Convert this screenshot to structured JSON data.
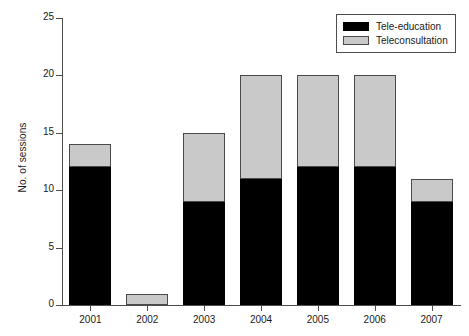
{
  "chart_data": {
    "type": "bar",
    "stacked": true,
    "title": "",
    "xlabel": "",
    "ylabel": "No. of sessions",
    "categories": [
      "2001",
      "2002",
      "2003",
      "2004",
      "2005",
      "2006",
      "2007"
    ],
    "series": [
      {
        "name": "Tele-education",
        "color": "#000000",
        "values": [
          12,
          0,
          9,
          11,
          12,
          12,
          9
        ]
      },
      {
        "name": "Teleconsultation",
        "color": "#c9c9c9",
        "values": [
          2,
          1,
          6,
          9,
          8,
          8,
          2
        ]
      }
    ],
    "totals": [
      14,
      1,
      15,
      20,
      20,
      20,
      11
    ],
    "ylim": [
      0,
      25
    ],
    "yticks": [
      0,
      5,
      10,
      15,
      20,
      25
    ],
    "ytick_labels": [
      "0",
      "5",
      "10",
      "15",
      "20",
      "25"
    ],
    "grid": false,
    "legend_position": "top-right"
  },
  "legend": {
    "items": [
      {
        "label": "Tele-education",
        "swatch": "black-swatch"
      },
      {
        "label": "Teleconsultation",
        "swatch": "gray-swatch"
      }
    ]
  }
}
